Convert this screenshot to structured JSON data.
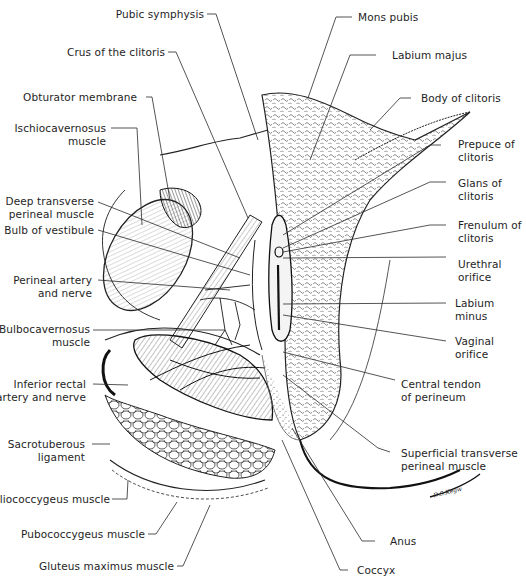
{
  "figure": {
    "type": "anatomical-illustration",
    "signature": "D.S.Kegw"
  },
  "labels_left": [
    {
      "id": "pubic-symphysis",
      "lines": [
        "Pubic symphysis"
      ]
    },
    {
      "id": "crus-of-clitoris",
      "lines": [
        "Crus of the clitoris"
      ]
    },
    {
      "id": "obturator-membrane",
      "lines": [
        "Obturator membrane"
      ]
    },
    {
      "id": "ischiocavernosus-muscle",
      "lines": [
        "Ischiocavernosus",
        "muscle"
      ]
    },
    {
      "id": "deep-transverse-perineal-muscle",
      "lines": [
        "Deep transverse",
        "perineal muscle"
      ]
    },
    {
      "id": "bulb-of-vestibule",
      "lines": [
        "Bulb of vestibule"
      ]
    },
    {
      "id": "perineal-artery-and-nerve",
      "lines": [
        "Perineal artery",
        "and nerve"
      ]
    },
    {
      "id": "bulbocavernosus-muscle",
      "lines": [
        "Bulbocavernosus",
        "muscle"
      ]
    },
    {
      "id": "inferior-rectal-artery-and-nerve",
      "lines": [
        "Inferior rectal",
        "artery and nerve"
      ]
    },
    {
      "id": "sacrotuberous-ligament",
      "lines": [
        "Sacrotuberous",
        "ligament"
      ]
    },
    {
      "id": "iliococcygeus-muscle",
      "lines": [
        "Iliococcygeus muscle"
      ]
    },
    {
      "id": "pubococcygeus-muscle",
      "lines": [
        "Pubococcygeus muscle"
      ]
    },
    {
      "id": "gluteus-maximus-muscle",
      "lines": [
        "Gluteus maximus muscle"
      ]
    }
  ],
  "labels_right": [
    {
      "id": "mons-pubis",
      "lines": [
        "Mons pubis"
      ]
    },
    {
      "id": "labium-majus",
      "lines": [
        "Labium majus"
      ]
    },
    {
      "id": "body-of-clitoris",
      "lines": [
        "Body of clitoris"
      ]
    },
    {
      "id": "prepuce-of-clitoris",
      "lines": [
        "Prepuce of",
        "clitoris"
      ]
    },
    {
      "id": "glans-of-clitoris",
      "lines": [
        "Glans of",
        "clitoris"
      ]
    },
    {
      "id": "frenulum-of-clitoris",
      "lines": [
        "Frenulum of",
        "clitoris"
      ]
    },
    {
      "id": "urethral-orifice",
      "lines": [
        "Urethral",
        "orifice"
      ]
    },
    {
      "id": "labium-minus",
      "lines": [
        "Labium",
        "minus"
      ]
    },
    {
      "id": "vaginal-orifice",
      "lines": [
        "Vaginal",
        "orifice"
      ]
    },
    {
      "id": "central-tendon-of-perineum",
      "lines": [
        "Central tendon",
        "of perineum"
      ]
    },
    {
      "id": "superficial-transverse-perineal-muscle",
      "lines": [
        "Superficial transverse",
        "perineal muscle"
      ]
    },
    {
      "id": "anus",
      "lines": [
        "Anus"
      ]
    },
    {
      "id": "coccyx",
      "lines": [
        "Coccyx"
      ]
    }
  ],
  "colors": {
    "ink": "#1e1e1e",
    "background": "#ffffff",
    "shade": "#8a8a8a"
  }
}
